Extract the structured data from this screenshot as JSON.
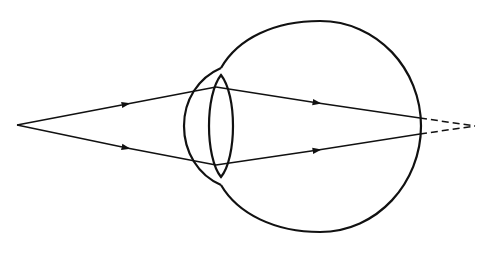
{
  "diagram": {
    "stroke_color": "#111111",
    "background": "#ffffff",
    "elements": {
      "eyeball": {
        "cx": 320,
        "cy": 126,
        "rx": 101,
        "ry": 105
      },
      "cornea": {
        "top": [
          221,
          68
        ],
        "bottom": [
          221,
          185
        ],
        "leftmost_x": 184
      },
      "lens": {
        "top": [
          221,
          75
        ],
        "bottom": [
          221,
          177
        ],
        "left_x": 209,
        "right_x": 233
      },
      "source_point": [
        17,
        125
      ],
      "focus_point": [
        475,
        126
      ],
      "rays": [
        {
          "name": "upper",
          "points": [
            [
              17,
              125
            ],
            [
              216,
              87
            ],
            [
              420,
              118
            ]
          ],
          "arrows": [
            [
              127,
              104
            ],
            [
              318,
              103
            ]
          ]
        },
        {
          "name": "lower",
          "points": [
            [
              17,
              125
            ],
            [
              216,
              165
            ],
            [
              420,
              134
            ]
          ],
          "arrows": [
            [
              127,
              148
            ],
            [
              318,
              150
            ]
          ]
        }
      ],
      "extensions": [
        {
          "name": "upper-dashed",
          "from": [
            420,
            118
          ],
          "to": [
            475,
            126
          ]
        },
        {
          "name": "lower-dashed",
          "from": [
            420,
            134
          ],
          "to": [
            475,
            126
          ]
        }
      ]
    }
  }
}
